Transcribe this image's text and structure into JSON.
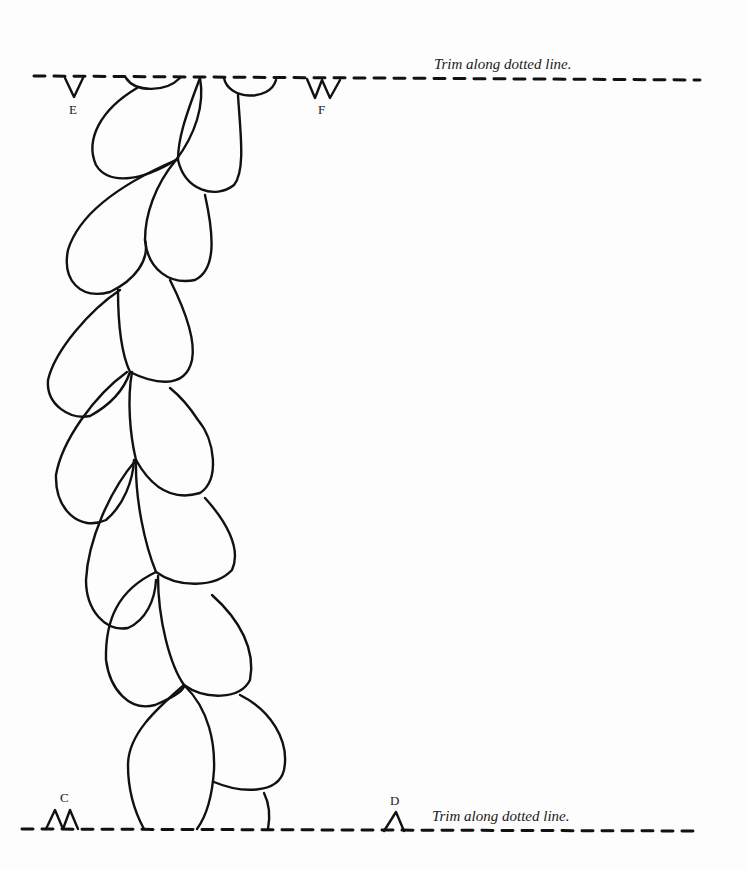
{
  "document": {
    "type": "printable template",
    "top_edge": {
      "instruction": "Trim along dotted line.",
      "markers": [
        {
          "label": "E",
          "shape": "single-notch"
        },
        {
          "label": "F",
          "shape": "double-notch"
        }
      ]
    },
    "bottom_edge": {
      "instruction": "Trim along dotted line.",
      "markers": [
        {
          "label": "C",
          "shape": "double-peak"
        },
        {
          "label": "D",
          "shape": "single-peak"
        }
      ]
    },
    "artwork": {
      "description": "Vertical vine of teardrop-shaped leaf outlines",
      "stroke_color": "#111111",
      "line_color": "#111111"
    }
  }
}
